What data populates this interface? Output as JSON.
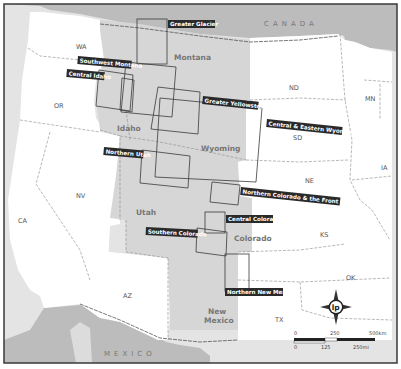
{
  "map": {
    "countries": {
      "north": "CANADA",
      "south": "MEXICO"
    },
    "states": [
      {
        "id": "wa",
        "label": "WA"
      },
      {
        "id": "or",
        "label": "OR"
      },
      {
        "id": "ca",
        "label": "CA"
      },
      {
        "id": "nv",
        "label": "NV"
      },
      {
        "id": "az",
        "label": "AZ"
      },
      {
        "id": "idaho",
        "label": "Idaho"
      },
      {
        "id": "montana",
        "label": "Montana"
      },
      {
        "id": "wyoming",
        "label": "Wyoming"
      },
      {
        "id": "utah",
        "label": "Utah"
      },
      {
        "id": "colorado",
        "label": "Colorado"
      },
      {
        "id": "new_mexico_1",
        "label": "New"
      },
      {
        "id": "new_mexico_2",
        "label": "Mexico"
      },
      {
        "id": "nd",
        "label": "ND"
      },
      {
        "id": "sd",
        "label": "SD"
      },
      {
        "id": "ne",
        "label": "NE"
      },
      {
        "id": "ks",
        "label": "KS"
      },
      {
        "id": "ok",
        "label": "OK"
      },
      {
        "id": "tx",
        "label": "TX"
      },
      {
        "id": "mn",
        "label": "MN"
      },
      {
        "id": "ia",
        "label": "IA"
      }
    ],
    "regions": [
      {
        "id": "greater_glacier",
        "label": "Greater Glacier"
      },
      {
        "id": "southwest_montana",
        "label": "Southwest Montana"
      },
      {
        "id": "central_idaho",
        "label": "Central Idaho"
      },
      {
        "id": "greater_yellowstone",
        "label": "Greater Yellowstone"
      },
      {
        "id": "central_eastern_wyoming",
        "label": "Central & Eastern Wyoming"
      },
      {
        "id": "northern_utah",
        "label": "Northern Utah"
      },
      {
        "id": "northern_colorado",
        "label": "Northern Colorado & the Front Range"
      },
      {
        "id": "central_colorado",
        "label": "Central Colorado"
      },
      {
        "id": "southern_colorado",
        "label": "Southern Colorado"
      },
      {
        "id": "northern_new_mexico",
        "label": "Northern New Mexico"
      }
    ],
    "compass": {
      "logo": "lp"
    },
    "scale": {
      "km_ticks": [
        "0",
        "250",
        "500km"
      ],
      "mi_ticks": [
        "0",
        "125",
        "250mi"
      ]
    },
    "colors": {
      "highlight_states": "#d6d6d6",
      "other_land": "#ffffff",
      "foreign_land": "#bdbdbd",
      "water": "#e2e2e2",
      "label_bg": "#2a2a2a",
      "frame": "#3a3a3a"
    }
  }
}
